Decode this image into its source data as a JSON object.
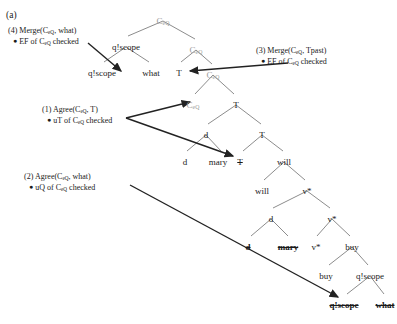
{
  "figure": {
    "panel_label": "(a)",
    "type": "syntactic-derivation-tree",
    "notation": {
      "head_label": "C",
      "head_subscript": "eQ",
      "strikethrough_meaning": "deleted-copy"
    }
  },
  "annotations": [
    {
      "id": "annot-4",
      "number": "(4)",
      "operation": "Merge(C_eQ, what)",
      "line1_pre": "(4) Merge(C",
      "line1_sub": "eQ",
      "line1_post": ", what)",
      "line2_pre": "EF of C",
      "line2_sub": "eQ",
      "line2_post": " checked",
      "x": 8,
      "y": 26
    },
    {
      "id": "annot-3",
      "number": "(3)",
      "operation": "Merge(C_eQ, Tpast)",
      "line1_pre": "(3) Merge(C",
      "line1_sub": "eQ",
      "line1_post": ", Tpast)",
      "line2_pre": "EF of C",
      "line2_sub": "eQ",
      "line2_post": " checked",
      "x": 256,
      "y": 46
    },
    {
      "id": "annot-1",
      "number": "(1)",
      "operation": "Agree(C_eQ, T)",
      "line1_pre": "(1) Agree(C",
      "line1_sub": "eQ",
      "line1_post": ", T)",
      "line2_pre": "uT of C",
      "line2_sub": "eQ",
      "line2_post": " checked",
      "x": 42,
      "y": 105
    },
    {
      "id": "annot-2",
      "number": "(2)",
      "operation": "Agree(C_eQ, what)",
      "line1_pre": "(2) Agree(C",
      "line1_sub": "eQ",
      "line1_post": ", what)",
      "line2_pre": "uQ of C",
      "line2_sub": "eQ",
      "line2_post": " checked",
      "x": 24,
      "y": 172
    }
  ],
  "tree_nodes": [
    {
      "id": "n-root-ceq",
      "label_pre": "C",
      "label_sub": "eQ",
      "label_post": "",
      "x": 163,
      "y": 16,
      "style": "gray"
    },
    {
      "id": "n-qscope-top",
      "label_pre": "q!scope",
      "label_sub": "",
      "label_post": "",
      "x": 126,
      "y": 42,
      "style": "plain"
    },
    {
      "id": "n-ceq-2",
      "label_pre": "C",
      "label_sub": "eQ",
      "label_post": "",
      "x": 196,
      "y": 45,
      "style": "gray"
    },
    {
      "id": "n-qscope-left",
      "label_pre": "q!scope",
      "label_sub": "",
      "label_post": "",
      "x": 102,
      "y": 68,
      "style": "plain"
    },
    {
      "id": "n-what-left",
      "label_pre": "what",
      "label_sub": "",
      "label_post": "",
      "x": 151,
      "y": 68,
      "style": "plain"
    },
    {
      "id": "n-t-1",
      "label_pre": "T",
      "label_sub": "",
      "label_post": "",
      "x": 179,
      "y": 68,
      "style": "plain"
    },
    {
      "id": "n-ceq-3",
      "label_pre": "C",
      "label_sub": "eQ",
      "label_post": "",
      "x": 213,
      "y": 70,
      "style": "gray"
    },
    {
      "id": "n-ceq-4",
      "label_pre": "C",
      "label_sub": "eQ",
      "label_post": "",
      "x": 193,
      "y": 100,
      "style": "gray"
    },
    {
      "id": "n-t-2",
      "label_pre": "T",
      "label_sub": "",
      "label_post": "",
      "x": 236,
      "y": 100,
      "style": "plain"
    },
    {
      "id": "n-d-1",
      "label_pre": "d",
      "label_sub": "",
      "label_post": "",
      "x": 206,
      "y": 130,
      "style": "plain"
    },
    {
      "id": "n-t-3",
      "label_pre": "T",
      "label_sub": "",
      "label_post": "",
      "x": 262,
      "y": 130,
      "style": "plain"
    },
    {
      "id": "n-d-2",
      "label_pre": "d",
      "label_sub": "",
      "label_post": "",
      "x": 185,
      "y": 157,
      "style": "plain"
    },
    {
      "id": "n-mary-1",
      "label_pre": "mary",
      "label_sub": "",
      "label_post": "",
      "x": 218,
      "y": 157,
      "style": "plain"
    },
    {
      "id": "n-t-struck",
      "label_pre": "T",
      "label_sub": "",
      "label_post": "",
      "x": 240,
      "y": 157,
      "style": "strike"
    },
    {
      "id": "n-will-1",
      "label_pre": "will",
      "label_sub": "",
      "label_post": "",
      "x": 284,
      "y": 157,
      "style": "plain"
    },
    {
      "id": "n-will-2",
      "label_pre": "will",
      "label_sub": "",
      "label_post": "",
      "x": 262,
      "y": 186,
      "style": "plain"
    },
    {
      "id": "n-vstar-1",
      "label_pre": "v*",
      "label_sub": "",
      "label_post": "",
      "x": 307,
      "y": 186,
      "style": "plain"
    },
    {
      "id": "n-d-3",
      "label_pre": "d",
      "label_sub": "",
      "label_post": "",
      "x": 271,
      "y": 214,
      "style": "plain"
    },
    {
      "id": "n-vstar-2",
      "label_pre": "v*",
      "label_sub": "",
      "label_post": "",
      "x": 332,
      "y": 214,
      "style": "plain"
    },
    {
      "id": "n-d-struck",
      "label_pre": "d",
      "label_sub": "",
      "label_post": "",
      "x": 248,
      "y": 242,
      "style": "strike-bold"
    },
    {
      "id": "n-mary-struck",
      "label_pre": "mary",
      "label_sub": "",
      "label_post": "",
      "x": 288,
      "y": 242,
      "style": "strike-bold"
    },
    {
      "id": "n-vstar-3",
      "label_pre": "v*",
      "label_sub": "",
      "label_post": "",
      "x": 316,
      "y": 242,
      "style": "plain"
    },
    {
      "id": "n-buy-1",
      "label_pre": "buy",
      "label_sub": "",
      "label_post": "",
      "x": 352,
      "y": 242,
      "style": "plain"
    },
    {
      "id": "n-buy-2",
      "label_pre": "buy",
      "label_sub": "",
      "label_post": "",
      "x": 326,
      "y": 271,
      "style": "plain"
    },
    {
      "id": "n-qscope-low",
      "label_pre": "q!scope",
      "label_sub": "",
      "label_post": "",
      "x": 370,
      "y": 271,
      "style": "plain"
    },
    {
      "id": "n-qscope-struck",
      "label_pre": "q!scope",
      "label_sub": "",
      "label_post": "",
      "x": 344,
      "y": 300,
      "style": "strike-bold"
    },
    {
      "id": "n-what-struck",
      "label_pre": "what",
      "label_sub": "",
      "label_post": "",
      "x": 385,
      "y": 300,
      "style": "strike-bold"
    }
  ],
  "colors": {
    "ink": "#1a1a1a",
    "gray_node": "#9a9a9a",
    "branch": "#6e6e6e",
    "arrow": "#222222",
    "background": "#ffffff"
  }
}
